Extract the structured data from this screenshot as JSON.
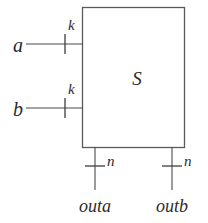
{
  "diagram": {
    "type": "block-diagram",
    "title": "",
    "block": {
      "label": "S",
      "x": 82,
      "y": 7,
      "width": 103,
      "height": 141
    },
    "inputs": [
      {
        "name": "a",
        "label": "a",
        "bus_width_label": "k",
        "y": 44,
        "wire_x_start": 26,
        "wire_x_end": 82,
        "tick_x": 65
      },
      {
        "name": "b",
        "label": "b",
        "bus_width_label": "k",
        "y": 108,
        "wire_x_start": 26,
        "wire_x_end": 82,
        "tick_x": 65
      }
    ],
    "outputs": [
      {
        "name": "outa",
        "label": "outa",
        "bus_width_label": "n",
        "x": 95,
        "wire_y_start": 148,
        "wire_y_end": 190,
        "tick_y": 166
      },
      {
        "name": "outb",
        "label": "outb",
        "bus_width_label": "n",
        "x": 172,
        "wire_y_start": 148,
        "wire_y_end": 190,
        "tick_y": 166
      }
    ],
    "colors": {
      "background": "#ffffff",
      "stroke": "#4a4a4a",
      "box_stroke": "#5a5a5a",
      "text": "#2b2b2b"
    }
  }
}
